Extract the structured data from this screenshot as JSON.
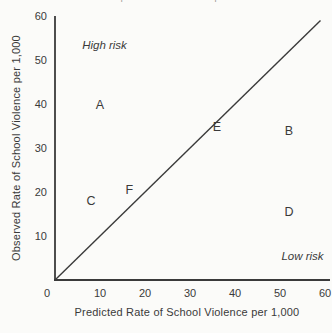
{
  "figure": {
    "top_cropped_text": "of predictions and consequences",
    "colors": {
      "ink": "#3a3a3a",
      "background": "#fbfbf9",
      "cropped_text": "#949490"
    }
  },
  "chart_data": {
    "type": "scatter",
    "title": "",
    "xlabel": "Predicted Rate of School Violence per 1,000",
    "ylabel": "Observed Rate of School Violence per 1,000",
    "xlim": [
      0,
      60
    ],
    "ylim": [
      0,
      60
    ],
    "x_ticks": [
      0,
      10,
      20,
      30,
      40,
      50,
      60
    ],
    "y_ticks": [
      10,
      20,
      30,
      40,
      50,
      60
    ],
    "grid": false,
    "point_marker": "letter-label",
    "points": [
      {
        "label": "A",
        "x": 10,
        "y": 40
      },
      {
        "label": "B",
        "x": 52,
        "y": 34
      },
      {
        "label": "C",
        "x": 8,
        "y": 18
      },
      {
        "label": "D",
        "x": 52,
        "y": 15.5
      },
      {
        "label": "E",
        "x": 36,
        "y": 35
      },
      {
        "label": "F",
        "x": 16.5,
        "y": 20.5
      }
    ],
    "reference_line": {
      "from": [
        0,
        0
      ],
      "to": [
        59,
        59
      ]
    },
    "annotations": [
      {
        "text": "High risk",
        "x": 11,
        "y": 53.5,
        "style": "italic"
      },
      {
        "text": "Low risk",
        "x": 55,
        "y": 5.5,
        "style": "italic"
      }
    ]
  }
}
